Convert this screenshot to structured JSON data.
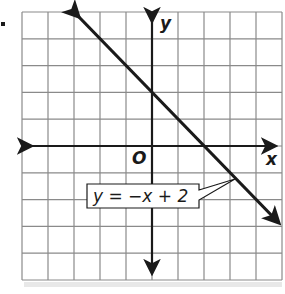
{
  "graph": {
    "bullet": "•",
    "x_axis_label": "x",
    "y_axis_label": "y",
    "origin_label": "O",
    "equation_label": "y = −x + 2",
    "grid": {
      "columns": 10,
      "rows": 10,
      "x_range": [
        -5,
        5
      ],
      "y_range": [
        -5,
        5
      ]
    },
    "line": {
      "slope": -1,
      "intercept": 2,
      "start": [
        -3,
        5
      ],
      "end": [
        5,
        -3
      ]
    },
    "colors": {
      "grid": "#8a8a8a",
      "axes": "#1a1a1a",
      "line": "#1a1a1a",
      "background": "#ffffff"
    }
  }
}
